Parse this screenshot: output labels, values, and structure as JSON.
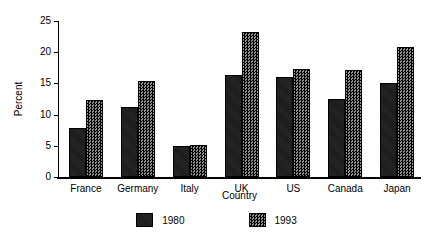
{
  "chart_data": {
    "type": "bar",
    "title": "",
    "xlabel": "Country",
    "ylabel": "Percent",
    "categories": [
      "France",
      "Germany",
      "Italy",
      "UK",
      "US",
      "Canada",
      "Japan"
    ],
    "series": [
      {
        "name": "1980",
        "values": [
          7.9,
          11.2,
          5.0,
          16.3,
          16.1,
          12.5,
          15.1
        ],
        "color": "#1a1a1a",
        "pattern": "solid-black"
      },
      {
        "name": "1993",
        "values": [
          12.4,
          15.4,
          5.2,
          23.2,
          17.3,
          17.2,
          20.8
        ],
        "color": "#3d3d3d",
        "pattern": "checkerboard"
      }
    ],
    "ylim": [
      0,
      25
    ],
    "yticks": [
      0,
      5,
      10,
      15,
      20,
      25
    ],
    "yticklabels": [
      "0",
      "5",
      "10",
      "15",
      "20",
      "25"
    ],
    "grid": false,
    "legend_position": "below-axes",
    "legend_entries": [
      "1980",
      "1993"
    ]
  }
}
